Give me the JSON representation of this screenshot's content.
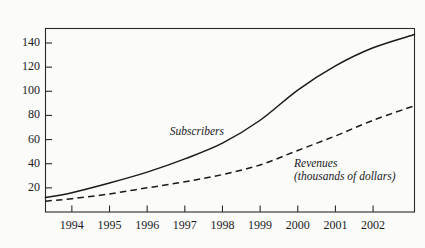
{
  "chart_data": {
    "type": "line",
    "title": "",
    "subtitle": "",
    "unit_label": "Millions",
    "xlabel": "",
    "ylabel": "Millions",
    "grid": false,
    "legend_position": "inline-annotations",
    "xlim": [
      1993.3,
      2003.1
    ],
    "ylim": [
      0,
      152
    ],
    "yticks": [
      20,
      40,
      60,
      80,
      100,
      120,
      140
    ],
    "ytick_labels": [
      "20",
      "40",
      "60",
      "80",
      "100",
      "120",
      "140"
    ],
    "xticks": [
      1994,
      1995,
      1996,
      1997,
      1998,
      1999,
      2000,
      2001,
      2002
    ],
    "xtick_labels": [
      "1994",
      "1995",
      "1996",
      "1997",
      "1998",
      "1999",
      "2000",
      "2001",
      "2002"
    ],
    "x": [
      1993.3,
      1994,
      1995,
      1996,
      1997,
      1998,
      1999,
      2000,
      2001,
      2002,
      2003.1
    ],
    "series": [
      {
        "name": "Subscribers",
        "style": "solid",
        "color": "#1a1a1a",
        "annotation": "Subscribers",
        "values": [
          12,
          16,
          24,
          33,
          44,
          57,
          76,
          101,
          121,
          136,
          147
        ]
      },
      {
        "name": "Revenues",
        "style": "dashed",
        "color": "#1a1a1a",
        "annotation": "Revenues",
        "annotation_sub": "(thousands of dollars)",
        "values": [
          9,
          11,
          15,
          20,
          25,
          31,
          39,
          51,
          63,
          76,
          88
        ]
      }
    ],
    "annotations": [
      {
        "text": "Subscribers",
        "x": 1996.6,
        "y": 66
      },
      {
        "text": "Revenues",
        "x": 1999.9,
        "y": 40
      },
      {
        "text": "(thousands of dollars)",
        "x": 1999.9,
        "y": 33
      }
    ],
    "colors": {
      "background": "#fbfbfa",
      "axis": "#2a2a2a",
      "text": "#1a1a1a",
      "subscribers_line": "#1a1a1a",
      "revenues_line": "#1a1a1a"
    }
  }
}
